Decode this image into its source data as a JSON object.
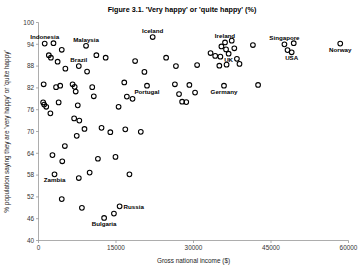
{
  "chart_data": {
    "type": "scatter",
    "title": "Figure 3.1. 'Very happy' or 'quite happy' (%)",
    "xlabel": "Gross national income ($)",
    "ylabel": "% population saying they are 'very happy' or 'quite happy'",
    "xlim": [
      0,
      60000
    ],
    "ylim": [
      40,
      100
    ],
    "xticks": [
      0,
      15000,
      30000,
      45000,
      60000
    ],
    "xtick_labels": [
      "0",
      "15000",
      "30000",
      "45000",
      "60000"
    ],
    "yticks": [
      40,
      46,
      52,
      58,
      64,
      70,
      76,
      82,
      88,
      94,
      100
    ],
    "ytick_labels": [
      "40",
      "46",
      "52",
      "58",
      "64",
      "70",
      "76",
      "82",
      "88",
      "94",
      "100"
    ],
    "grid": false,
    "legend": false,
    "marker": "open-circle",
    "points": [
      {
        "x": 1200,
        "y": 94.2,
        "label": "Indonesia",
        "label_pos": "above"
      },
      {
        "x": 2900,
        "y": 94.3,
        "label": null
      },
      {
        "x": 2000,
        "y": 91.0,
        "label": null
      },
      {
        "x": 2400,
        "y": 90.3,
        "label": null
      },
      {
        "x": 4500,
        "y": 92.5,
        "label": null
      },
      {
        "x": 3700,
        "y": 89.2,
        "label": null
      },
      {
        "x": 9200,
        "y": 93.6,
        "label": "Malaysia",
        "label_pos": "above"
      },
      {
        "x": 11200,
        "y": 91.0,
        "label": null
      },
      {
        "x": 13000,
        "y": 90.3,
        "label": null
      },
      {
        "x": 7800,
        "y": 88.0,
        "label": "Brazil",
        "label_pos": "above"
      },
      {
        "x": 5200,
        "y": 87.3,
        "label": null
      },
      {
        "x": 9400,
        "y": 86.5,
        "label": null
      },
      {
        "x": 1000,
        "y": 83.0,
        "label": null
      },
      {
        "x": 3400,
        "y": 82.2,
        "label": null
      },
      {
        "x": 4200,
        "y": 82.6,
        "label": null
      },
      {
        "x": 6600,
        "y": 83.0,
        "label": null
      },
      {
        "x": 7000,
        "y": 82.3,
        "label": null
      },
      {
        "x": 7200,
        "y": 81.0,
        "label": null
      },
      {
        "x": 10400,
        "y": 82.2,
        "label": null
      },
      {
        "x": 10700,
        "y": 79.7,
        "label": null
      },
      {
        "x": 900,
        "y": 78.0,
        "label": null
      },
      {
        "x": 1100,
        "y": 77.4,
        "label": null
      },
      {
        "x": 1500,
        "y": 76.8,
        "label": null
      },
      {
        "x": 3900,
        "y": 78.0,
        "label": null
      },
      {
        "x": 7600,
        "y": 77.2,
        "label": null
      },
      {
        "x": 2300,
        "y": 75.0,
        "label": null
      },
      {
        "x": 6900,
        "y": 73.6,
        "label": null
      },
      {
        "x": 7900,
        "y": 73.0,
        "label": null
      },
      {
        "x": 8900,
        "y": 70.7,
        "label": null
      },
      {
        "x": 7400,
        "y": 68.8,
        "label": null
      },
      {
        "x": 5100,
        "y": 66.0,
        "label": null
      },
      {
        "x": 12200,
        "y": 71.0,
        "label": null
      },
      {
        "x": 13900,
        "y": 69.8,
        "label": null
      },
      {
        "x": 14900,
        "y": 63.0,
        "label": null
      },
      {
        "x": 2700,
        "y": 63.5,
        "label": null
      },
      {
        "x": 4600,
        "y": 61.8,
        "label": null
      },
      {
        "x": 11500,
        "y": 62.5,
        "label": null
      },
      {
        "x": 3100,
        "y": 58.2,
        "label": "Zambia",
        "label_pos": "below"
      },
      {
        "x": 7800,
        "y": 57.2,
        "label": null
      },
      {
        "x": 9900,
        "y": 58.7,
        "label": null
      },
      {
        "x": 17600,
        "y": 58.2,
        "label": null
      },
      {
        "x": 4500,
        "y": 51.4,
        "label": null
      },
      {
        "x": 8400,
        "y": 49.0,
        "label": null
      },
      {
        "x": 12700,
        "y": 46.2,
        "label": "Bulgaria",
        "label_pos": "below"
      },
      {
        "x": 14600,
        "y": 47.4,
        "label": null
      },
      {
        "x": 15700,
        "y": 49.4,
        "label": "Russia",
        "label_pos": "right"
      },
      {
        "x": 16600,
        "y": 83.5,
        "label": null
      },
      {
        "x": 17100,
        "y": 79.6,
        "label": null
      },
      {
        "x": 18200,
        "y": 79.0,
        "label": null
      },
      {
        "x": 15500,
        "y": 76.8,
        "label": null
      },
      {
        "x": 16800,
        "y": 70.6,
        "label": null
      },
      {
        "x": 19800,
        "y": 69.9,
        "label": null
      },
      {
        "x": 20500,
        "y": 86.4,
        "label": null
      },
      {
        "x": 22100,
        "y": 96.0,
        "label": "Iceland",
        "label_pos": "above"
      },
      {
        "x": 18700,
        "y": 89.4,
        "label": null
      },
      {
        "x": 24700,
        "y": 90.3,
        "label": null
      },
      {
        "x": 21000,
        "y": 82.6,
        "label": "Portugal",
        "label_pos": "below"
      },
      {
        "x": 26400,
        "y": 83.0,
        "label": null
      },
      {
        "x": 29200,
        "y": 82.8,
        "label": null
      },
      {
        "x": 26600,
        "y": 88.0,
        "label": null
      },
      {
        "x": 30700,
        "y": 88.3,
        "label": null
      },
      {
        "x": 27200,
        "y": 80.3,
        "label": null
      },
      {
        "x": 30300,
        "y": 80.7,
        "label": null
      },
      {
        "x": 27800,
        "y": 78.2,
        "label": null
      },
      {
        "x": 28600,
        "y": 78.1,
        "label": null
      },
      {
        "x": 33300,
        "y": 91.6,
        "label": null
      },
      {
        "x": 34200,
        "y": 90.8,
        "label": null
      },
      {
        "x": 35200,
        "y": 90.6,
        "label": null
      },
      {
        "x": 36100,
        "y": 94.5,
        "label": "Ireland",
        "label_pos": "above"
      },
      {
        "x": 37400,
        "y": 95.0,
        "label": null
      },
      {
        "x": 36300,
        "y": 92.6,
        "label": null
      },
      {
        "x": 37900,
        "y": 92.9,
        "label": null
      },
      {
        "x": 35400,
        "y": 93.4,
        "label": null
      },
      {
        "x": 36800,
        "y": 91.4,
        "label": "UK",
        "label_pos": "below"
      },
      {
        "x": 38400,
        "y": 90.0,
        "label": null
      },
      {
        "x": 35000,
        "y": 88.1,
        "label": null
      },
      {
        "x": 36400,
        "y": 88.4,
        "label": null
      },
      {
        "x": 38900,
        "y": 88.6,
        "label": null
      },
      {
        "x": 35900,
        "y": 82.6,
        "label": "Germany",
        "label_pos": "below"
      },
      {
        "x": 41500,
        "y": 93.8,
        "label": null
      },
      {
        "x": 42500,
        "y": 82.8,
        "label": null
      },
      {
        "x": 47600,
        "y": 94.0,
        "label": "Singapore",
        "label_pos": "above"
      },
      {
        "x": 49400,
        "y": 94.3,
        "label": null
      },
      {
        "x": 48200,
        "y": 92.4,
        "label": null
      },
      {
        "x": 49000,
        "y": 91.8,
        "label": "USA",
        "label_pos": "below"
      },
      {
        "x": 58400,
        "y": 94.2,
        "label": "Norway",
        "label_pos": "below"
      }
    ]
  }
}
